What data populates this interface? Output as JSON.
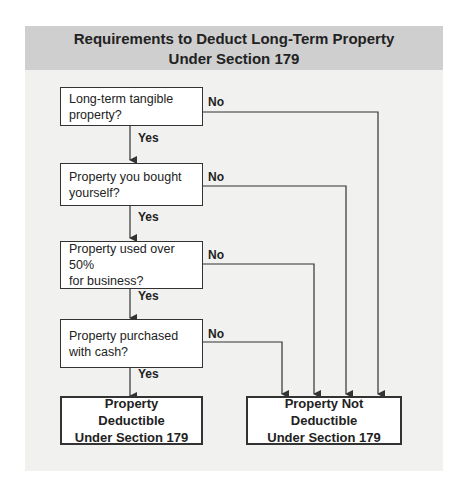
{
  "title": {
    "line1": "Requirements to Deduct Long-Term Property",
    "line2": "Under Section 179"
  },
  "questions": [
    {
      "line1": "Long-term tangible",
      "line2": "property?",
      "no_label": "No",
      "yes_label": "Yes"
    },
    {
      "line1": "Property you bought",
      "line2": "yourself?",
      "no_label": "No",
      "yes_label": "Yes"
    },
    {
      "line1": "Property used over 50%",
      "line2": "for business?",
      "no_label": "No",
      "yes_label": "Yes"
    },
    {
      "line1": "Property purchased",
      "line2": "with cash?",
      "no_label": "No",
      "yes_label": "Yes"
    }
  ],
  "outcomes": {
    "deductible": {
      "line1": "Property Deductible",
      "line2": "Under Section 179"
    },
    "not_deductible": {
      "line1": "Property Not Deductible",
      "line2": "Under Section 179"
    }
  },
  "colors": {
    "header_bg": "#cfcfcf",
    "panel_bg": "#f1f1f0",
    "line": "#333333"
  }
}
